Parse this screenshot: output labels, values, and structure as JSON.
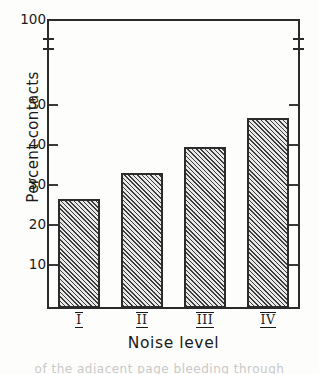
{
  "chart_data": {
    "type": "bar",
    "title": "",
    "subtitle": "",
    "xlabel": "Noise level",
    "ylabel": "Percent contacts",
    "categories": [
      "I",
      "II",
      "III",
      "IV"
    ],
    "values": [
      26.3,
      32.8,
      39.2,
      46.5
    ],
    "series": [
      {
        "name": "Percent contacts",
        "values": [
          26.3,
          32.8,
          39.2,
          46.5
        ]
      }
    ],
    "ytick_labels": [
      "100",
      "50",
      "40",
      "30",
      "20",
      "10"
    ],
    "ytick_values": [
      100,
      50,
      40,
      30,
      20,
      10
    ],
    "ylim": [
      5,
      100
    ],
    "axis_break": true,
    "axis_break_between": [
      50,
      100
    ],
    "grid": false,
    "legend": null,
    "bar_fill": "hatched-diagonal",
    "bar_edge_color": "#2b2b2b",
    "bar_face_color": "#d9d9d9"
  },
  "axis": {
    "y_title": "Percent contacts",
    "x_title": "Noise level",
    "y_ticks": [
      {
        "label": "100",
        "value": 100
      },
      {
        "label": "50",
        "value": 50
      },
      {
        "label": "40",
        "value": 40
      },
      {
        "label": "30",
        "value": 30
      },
      {
        "label": "20",
        "value": 20
      },
      {
        "label": "10",
        "value": 10
      }
    ],
    "x_ticks": [
      {
        "label": "I"
      },
      {
        "label": "II"
      },
      {
        "label": "III"
      },
      {
        "label": "IV"
      }
    ]
  },
  "artifact": {
    "bottom_text": "of the adjacent page bleeding through"
  }
}
